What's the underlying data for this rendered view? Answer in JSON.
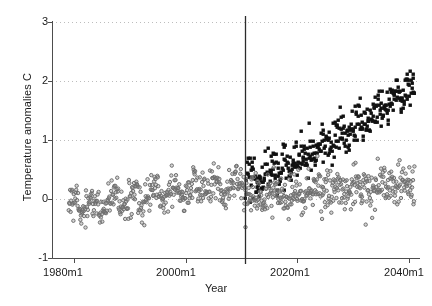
{
  "chart_data": {
    "type": "scatter",
    "title": "",
    "xlabel": "Year",
    "ylabel": "Temperature anomalies C",
    "xlim": [
      1976,
      2042
    ],
    "ylim": [
      -1,
      3
    ],
    "xticks": [
      "1980m1",
      "2000m1",
      "2020m1",
      "2040m1"
    ],
    "xtick_values": [
      1980,
      2000,
      2020,
      2040
    ],
    "yticks": [
      "-1",
      "0",
      "1",
      "2",
      "3"
    ],
    "ytick_values": [
      -1,
      0,
      1,
      2,
      3
    ],
    "grid": "horizontal-dotted",
    "legend": "none",
    "annotations": [
      {
        "type": "vline",
        "x": 2010.7,
        "label": "forecast-start"
      }
    ],
    "marker_colors": {
      "observed": "#6b6b6b",
      "projection_high": "#111111",
      "projection_low": "#9a9a9a"
    },
    "series": [
      {
        "name": "Observed anomalies",
        "marker": "open-circle-gray",
        "x_start": 1979.0,
        "x_end": 2010.7,
        "trend_start": -0.13,
        "trend_end": 0.26,
        "noise": 0.15,
        "seasonal_amplitude": 0.12,
        "seasonal_period": 3.6,
        "n": 380,
        "seed": 17
      },
      {
        "name": "Projected anomalies (scenario high)",
        "marker": "filled-square-black",
        "x_start": 2010.7,
        "x_end": 2041.0,
        "trend_start": 0.28,
        "trend_end": 1.92,
        "noise": 0.17,
        "seasonal_amplitude": 0.07,
        "seasonal_period": 3.2,
        "n": 365,
        "seed": 43
      },
      {
        "name": "Projected anomalies (scenario low)",
        "marker": "open-circle-gray",
        "x_start": 2010.7,
        "x_end": 2041.0,
        "trend_start": 0.05,
        "trend_end": 0.25,
        "noise": 0.18,
        "seasonal_amplitude": 0.07,
        "seasonal_period": 3.9,
        "n": 365,
        "seed": 91
      }
    ]
  },
  "axis": {
    "y_title": "Temperature anomalies C",
    "x_title": "Year",
    "y_tick_labels": [
      "3",
      "2",
      "1",
      "0",
      "-1"
    ],
    "x_tick_labels": [
      "1980m1",
      "2000m1",
      "2020m1",
      "2040m1"
    ]
  }
}
